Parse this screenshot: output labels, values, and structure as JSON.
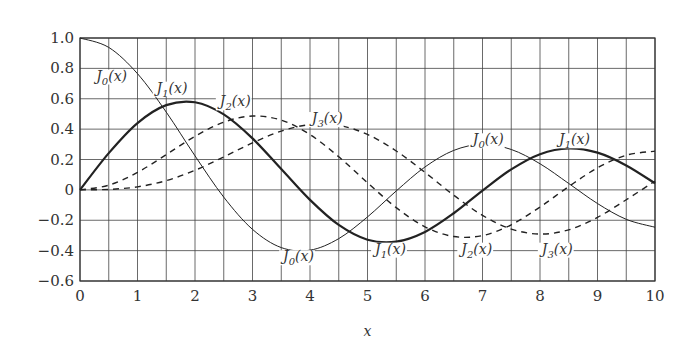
{
  "chart_data": {
    "type": "line",
    "title": "",
    "xlabel": "x",
    "ylabel": "",
    "xlim": [
      0,
      10
    ],
    "ylim": [
      -0.6,
      1.0
    ],
    "grid": true,
    "xticks": [
      "0",
      "1",
      "2",
      "3",
      "4",
      "5",
      "6",
      "7",
      "8",
      "9",
      "10"
    ],
    "yticks": [
      "1.0",
      "0.8",
      "0.6",
      "0.4",
      "0.2",
      "0",
      "−0.2",
      "−0.4",
      "−0.6"
    ],
    "x": [
      0,
      0.5,
      1,
      1.5,
      2,
      2.5,
      3,
      3.5,
      4,
      4.5,
      5,
      5.5,
      6,
      6.5,
      7,
      7.5,
      8,
      8.5,
      9,
      9.5,
      10
    ],
    "series": [
      {
        "name": "J0(x)",
        "style": "thin",
        "values": [
          1,
          0.938,
          0.765,
          0.512,
          0.224,
          -0.048,
          -0.26,
          -0.38,
          -0.397,
          -0.321,
          -0.178,
          -0.007,
          0.151,
          0.26,
          0.3,
          0.266,
          0.172,
          0.042,
          -0.09,
          -0.194,
          -0.246
        ]
      },
      {
        "name": "J1(x)",
        "style": "thick",
        "values": [
          0,
          0.242,
          0.44,
          0.558,
          0.577,
          0.497,
          0.339,
          0.137,
          -0.066,
          -0.231,
          -0.328,
          -0.341,
          -0.277,
          -0.154,
          -0.005,
          0.135,
          0.235,
          0.273,
          0.245,
          0.161,
          0.043
        ]
      },
      {
        "name": "J2(x)",
        "style": "dashed",
        "values": [
          0,
          0.031,
          0.115,
          0.232,
          0.353,
          0.446,
          0.486,
          0.459,
          0.364,
          0.218,
          0.047,
          -0.117,
          -0.243,
          -0.307,
          -0.301,
          -0.23,
          -0.113,
          0.022,
          0.145,
          0.228,
          0.255
        ]
      },
      {
        "name": "J3(x)",
        "style": "dashed",
        "values": [
          0,
          0.003,
          0.02,
          0.061,
          0.129,
          0.217,
          0.309,
          0.387,
          0.43,
          0.425,
          0.365,
          0.256,
          0.115,
          -0.035,
          -0.168,
          -0.258,
          -0.291,
          -0.263,
          -0.181,
          -0.065,
          0.058
        ]
      }
    ],
    "annotations": [
      {
        "text": "J0(x)",
        "x": 0.55,
        "y": 0.72
      },
      {
        "text": "J1(x)",
        "x": 1.6,
        "y": 0.64
      },
      {
        "text": "J2(x)",
        "x": 2.7,
        "y": 0.55
      },
      {
        "text": "J3(x)",
        "x": 4.3,
        "y": 0.44
      },
      {
        "text": "J0(x)",
        "x": 7.1,
        "y": 0.3
      },
      {
        "text": "J1(x)",
        "x": 8.6,
        "y": 0.3
      },
      {
        "text": "J0(x)",
        "x": 3.8,
        "y": -0.47
      },
      {
        "text": "J1(x)",
        "x": 5.4,
        "y": -0.42
      },
      {
        "text": "J2(x)",
        "x": 6.9,
        "y": -0.42
      },
      {
        "text": "J3(x)",
        "x": 8.3,
        "y": -0.42
      }
    ]
  }
}
